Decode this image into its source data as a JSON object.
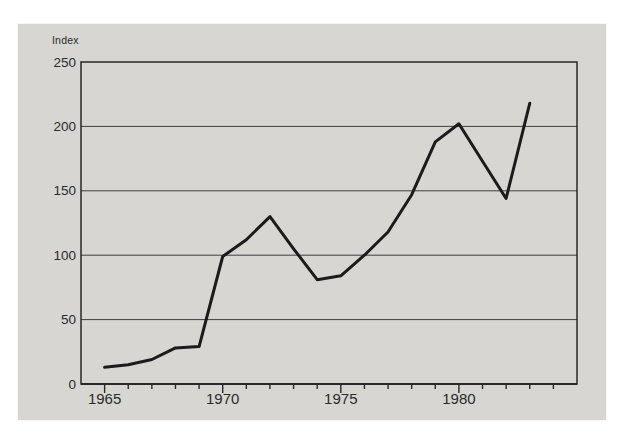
{
  "figure": {
    "panel_bg": "#d7d6d2",
    "page_bg": "#ffffff",
    "line_color": "#1b1b1b",
    "grid_color": "#3f3f3f",
    "border_color": "#282828",
    "text_color": "#2b2b2b",
    "axis_unit_label": "Index"
  },
  "chart_data": {
    "type": "line",
    "title": "",
    "xlabel": "",
    "ylabel": "Index",
    "legend": "none",
    "grid": "horizontal",
    "xlim": [
      1964,
      1985
    ],
    "ylim": [
      0,
      250
    ],
    "yticks": [
      0,
      50,
      100,
      150,
      200,
      250
    ],
    "xticks_labeled": [
      1965,
      1970,
      1975,
      1980
    ],
    "xticks_minor_start": 1965,
    "xticks_minor_end": 1984,
    "x": [
      1965,
      1966,
      1967,
      1968,
      1969,
      1970,
      1971,
      1972,
      1973,
      1974,
      1975,
      1976,
      1977,
      1978,
      1979,
      1980,
      1981,
      1982,
      1983
    ],
    "series": [
      {
        "name": "Index",
        "values": [
          13,
          15,
          19,
          28,
          29,
          99,
          112,
          130,
          105,
          81,
          84,
          100,
          118,
          147,
          188,
          202,
          173,
          144,
          218
        ]
      }
    ]
  }
}
